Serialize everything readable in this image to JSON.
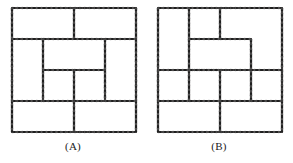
{
  "figure": {
    "background_color": "#ffffff",
    "line_color": "#403f3f",
    "panels": [
      {
        "id": "A",
        "caption": "(A)",
        "name": "panel-a",
        "description": "nested square spiral pattern on a 4 by 4 grid",
        "grid": {
          "cols": 4,
          "rows": 4,
          "pitch": 31,
          "origin_x": 12,
          "origin_y": 8
        },
        "segments": [
          [
            0,
            0,
            4,
            0
          ],
          [
            0,
            4,
            4,
            4
          ],
          [
            0,
            0,
            0,
            4
          ],
          [
            4,
            0,
            4,
            4
          ],
          [
            2,
            0,
            2,
            1
          ],
          [
            0,
            1,
            1,
            1
          ],
          [
            1,
            1,
            3,
            1
          ],
          [
            3,
            1,
            4,
            1
          ],
          [
            1,
            1,
            1,
            3
          ],
          [
            3,
            1,
            3,
            3
          ],
          [
            1,
            3,
            3,
            3
          ],
          [
            0,
            3,
            1,
            3
          ],
          [
            3,
            3,
            4,
            3
          ],
          [
            2,
            3,
            2,
            4
          ],
          [
            2,
            2,
            3,
            2
          ],
          [
            2,
            2,
            2,
            3
          ],
          [
            1,
            2,
            2,
            2
          ]
        ]
      },
      {
        "id": "B",
        "caption": "(B)",
        "name": "panel-b",
        "description": "L-tromino style tiling pattern on a 4 by 4 grid",
        "grid": {
          "cols": 4,
          "rows": 4,
          "pitch": 31,
          "origin_x": 12,
          "origin_y": 8
        },
        "segments": [
          [
            0,
            0,
            4,
            0
          ],
          [
            0,
            4,
            4,
            4
          ],
          [
            0,
            0,
            0,
            4
          ],
          [
            4,
            0,
            4,
            4
          ],
          [
            0,
            2,
            4,
            2
          ],
          [
            1,
            0,
            1,
            1
          ],
          [
            1,
            1,
            2,
            1
          ],
          [
            2,
            1,
            2,
            0
          ],
          [
            2,
            1,
            3,
            1
          ],
          [
            3,
            1,
            3,
            2
          ],
          [
            1,
            1,
            1,
            2
          ],
          [
            2,
            2,
            2,
            3
          ],
          [
            1,
            2,
            1,
            3
          ],
          [
            1,
            3,
            2,
            3
          ],
          [
            2,
            3,
            2,
            4
          ],
          [
            0,
            3,
            1,
            3
          ],
          [
            2,
            3,
            3,
            3
          ],
          [
            3,
            3,
            3,
            2
          ],
          [
            3,
            3,
            4,
            3
          ],
          [
            1,
            2,
            2,
            2
          ]
        ]
      }
    ]
  }
}
